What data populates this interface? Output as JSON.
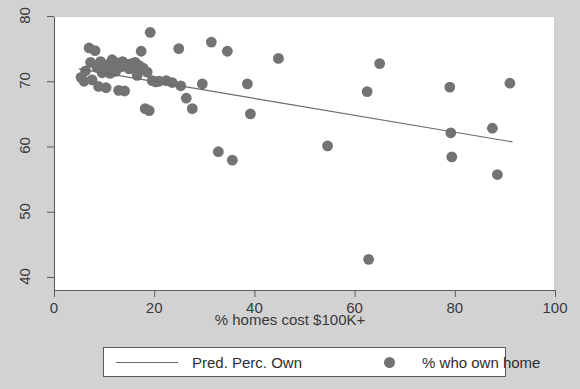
{
  "chart_data": {
    "type": "scatter",
    "title": "",
    "subtitle": "",
    "xlabel": "% homes cost $100K+",
    "ylabel": "",
    "xlim": [
      0,
      100
    ],
    "ylim": [
      38,
      80
    ],
    "xticks": [
      0,
      20,
      40,
      60,
      80,
      100
    ],
    "yticks": [
      40,
      50,
      60,
      70,
      80
    ],
    "grid": false,
    "legend_position": "bottom",
    "series": [
      {
        "name": "% who own home",
        "type": "scatter",
        "marker": "circle",
        "color": "#737373",
        "points": [
          [
            5.4,
            70.6
          ],
          [
            6.0,
            70.0
          ],
          [
            6.3,
            71.6
          ],
          [
            7.0,
            75.1
          ],
          [
            7.3,
            72.9
          ],
          [
            7.6,
            70.2
          ],
          [
            8.2,
            74.7
          ],
          [
            8.6,
            72.1
          ],
          [
            8.9,
            69.2
          ],
          [
            9.3,
            73.0
          ],
          [
            9.6,
            71.3
          ],
          [
            10.1,
            72.3
          ],
          [
            10.4,
            69.0
          ],
          [
            10.8,
            72.6
          ],
          [
            11.2,
            71.2
          ],
          [
            11.6,
            73.3
          ],
          [
            12.0,
            72.4
          ],
          [
            12.3,
            71.5
          ],
          [
            12.6,
            72.8
          ],
          [
            12.9,
            68.6
          ],
          [
            13.4,
            72.2
          ],
          [
            13.7,
            73.0
          ],
          [
            14.1,
            68.5
          ],
          [
            14.6,
            72.5
          ],
          [
            15.0,
            71.9
          ],
          [
            15.4,
            72.7
          ],
          [
            15.8,
            72.1
          ],
          [
            16.2,
            72.9
          ],
          [
            16.6,
            70.9
          ],
          [
            17.0,
            72.4
          ],
          [
            17.4,
            74.6
          ],
          [
            17.8,
            72.0
          ],
          [
            18.2,
            65.8
          ],
          [
            18.6,
            71.4
          ],
          [
            19.0,
            65.5
          ],
          [
            19.2,
            77.5
          ],
          [
            19.6,
            70.1
          ],
          [
            20.3,
            69.9
          ],
          [
            21.0,
            70.0
          ],
          [
            22.4,
            70.1
          ],
          [
            23.6,
            69.8
          ],
          [
            24.9,
            75.0
          ],
          [
            25.3,
            69.3
          ],
          [
            26.4,
            67.4
          ],
          [
            27.6,
            65.8
          ],
          [
            29.6,
            69.6
          ],
          [
            31.4,
            76.0
          ],
          [
            32.8,
            59.2
          ],
          [
            34.6,
            74.6
          ],
          [
            35.6,
            57.9
          ],
          [
            38.6,
            69.6
          ],
          [
            39.2,
            65.0
          ],
          [
            44.8,
            73.5
          ],
          [
            54.6,
            60.1
          ],
          [
            62.5,
            68.4
          ],
          [
            62.8,
            42.7
          ],
          [
            65.0,
            72.7
          ],
          [
            79.0,
            69.1
          ],
          [
            79.2,
            62.1
          ],
          [
            79.4,
            58.4
          ],
          [
            87.5,
            62.8
          ],
          [
            88.5,
            55.7
          ],
          [
            91.0,
            69.7
          ]
        ]
      },
      {
        "name": "Pred. Perc. Own",
        "type": "line",
        "color": "#6b6b6b",
        "endpoints": [
          [
            5.0,
            71.9
          ],
          [
            91.5,
            60.7
          ]
        ]
      }
    ]
  },
  "axes": {
    "x_tick_labels": [
      "0",
      "20",
      "40",
      "60",
      "80",
      "100"
    ],
    "y_tick_labels": [
      "40",
      "50",
      "60",
      "70",
      "80"
    ]
  },
  "legend": {
    "line_entry_label": "Pred. Perc. Own",
    "dot_entry_label": "% who own home"
  },
  "colors": {
    "background": "#d2d2d2",
    "plot_background": "#ffffff",
    "marker": "#737373",
    "line": "#6b6b6b",
    "axis": "#5a5a5a",
    "text": "#3a3a3a"
  }
}
